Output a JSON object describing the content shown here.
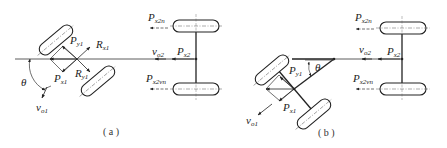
{
  "figure": {
    "panels": [
      {
        "id": "a",
        "caption": "( a )",
        "labels": {
          "Py1": {
            "main": "P",
            "sub": "y1"
          },
          "Rx1": {
            "main": "R",
            "sub": "x1"
          },
          "Ry1": {
            "main": "R",
            "sub": "y1"
          },
          "Px1": {
            "main": "P",
            "sub": "x1"
          },
          "theta": "θ",
          "vo1": {
            "main": "v",
            "sub": "o1"
          },
          "vo2": {
            "main": "v",
            "sub": "o2"
          },
          "Px2": {
            "main": "P",
            "sub": "x2"
          },
          "Px2n": {
            "main": "P",
            "sub": "x2n"
          },
          "Px2vn": {
            "main": "P",
            "sub": "x2vn"
          }
        }
      },
      {
        "id": "b",
        "caption": "( b )",
        "labels": {
          "Py1": {
            "main": "P",
            "sub": "y1"
          },
          "Px1": {
            "main": "P",
            "sub": "x1"
          },
          "theta": "θ",
          "vo1": {
            "main": "v",
            "sub": "o1"
          },
          "vo2": {
            "main": "v",
            "sub": "o2"
          },
          "Px2": {
            "main": "P",
            "sub": "x2"
          },
          "Px2n": {
            "main": "P",
            "sub": "x2n"
          },
          "Px2vn": {
            "main": "P",
            "sub": "x2vn"
          }
        }
      }
    ]
  }
}
